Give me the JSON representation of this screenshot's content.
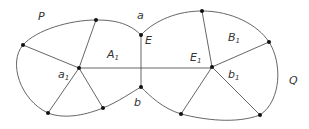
{
  "diagram": {
    "labels": {
      "P": "P",
      "Q": "Q",
      "a": "a",
      "b": "b",
      "E": "E",
      "A1_main": "A",
      "A1_sub": "1",
      "a1_main": "a",
      "a1_sub": "1",
      "E1_main": "E",
      "E1_sub": "1",
      "B1_main": "B",
      "B1_sub": "1",
      "b1_main": "b",
      "b1_sub": "1"
    },
    "regions": [
      {
        "name": "P",
        "center": "a1"
      },
      {
        "name": "Q",
        "center": "b1"
      }
    ],
    "edges": [
      {
        "from": "a1",
        "to": "b1",
        "label": "E1"
      },
      {
        "from": "a",
        "to": "b",
        "label": "E"
      }
    ]
  }
}
